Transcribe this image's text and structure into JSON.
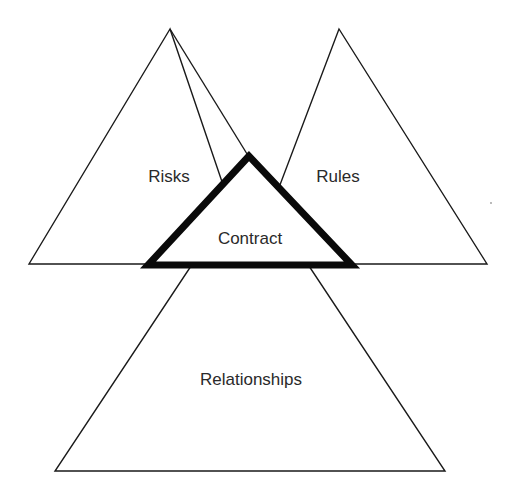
{
  "diagram": {
    "type": "overlapping-triangles",
    "background": "#ffffff",
    "line_color": "#1a1a1a",
    "nodes": [
      {
        "id": "risks",
        "label": "Risks",
        "shape": "triangle",
        "emphasis": "normal",
        "position": "top-left"
      },
      {
        "id": "rules",
        "label": "Rules",
        "shape": "triangle",
        "emphasis": "normal",
        "position": "top-right"
      },
      {
        "id": "contract",
        "label": "Contract",
        "shape": "triangle",
        "emphasis": "bold-outline",
        "position": "center"
      },
      {
        "id": "relationships",
        "label": "Relationships",
        "shape": "trapezoid",
        "emphasis": "normal",
        "position": "bottom"
      }
    ],
    "labels": {
      "risks": "Risks",
      "rules": "Rules",
      "contract": "Contract",
      "relationships": "Relationships"
    }
  }
}
